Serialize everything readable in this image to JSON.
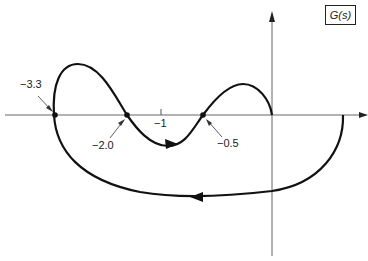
{
  "title_box": "G(s)",
  "labels": {
    "p1": "−3.3",
    "p2": "−2.0",
    "tick": "−1",
    "p3": "−0.5"
  },
  "diagram": {
    "type": "nyquist-plot",
    "real_axis_crossings": [
      -3.3,
      -2.0,
      -0.5
    ],
    "tick_marks": [
      -1
    ],
    "stroke_color": "#111111",
    "axis_color": "#555555"
  }
}
